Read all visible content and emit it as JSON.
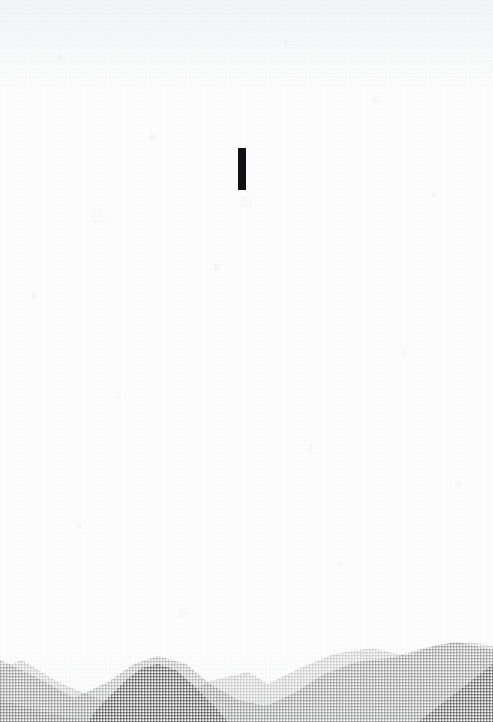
{
  "poster": {
    "width": 493,
    "height": 722,
    "background_color": "#fdfdfd",
    "paper_tone": "off-white mottled scan texture"
  },
  "mark": {
    "name": "vertical-bar-glyph",
    "description": "single bold black vertical stroke, like a text cursor or letter I",
    "color": "#111115",
    "x": 238,
    "y": 148,
    "width": 8,
    "height": 42
  },
  "mountains": {
    "texture": "crosshatch halftone grid",
    "baseline_y": 722,
    "layers": [
      {
        "name": "far-light-range",
        "color": "#e2e2e2",
        "path": "M0,676 L22,668 L58,690 L96,706 L140,714 L186,700 L214,688 L248,680 L268,692 L300,676 L334,662 L372,656 L406,664 L440,652 L470,650 L493,654 L493,100 L0,100 Z"
      },
      {
        "name": "mid-range",
        "color": "#cfcfcf",
        "path": "M0,668 L34,684 L74,706 L108,690 L134,672 L158,664 L186,672 L210,692 L238,708 L266,714 L296,700 L324,682 L356,670 L392,666 L424,656 L456,650 L493,658"
      },
      {
        "name": "near-dark-range",
        "color": "#969696",
        "path": "M96,710 L112,694 L126,680 L142,668 L158,664 L176,670 L192,684 L206,698 L218,710"
      },
      {
        "name": "right-dark-wedge",
        "color": "#9e9e9e",
        "path": "M418,722 L493,664 L493,722 Z"
      },
      {
        "name": "left-foreground-wedge",
        "color": "#bcbcbc",
        "path": "M0,700 L60,716 L96,722 L0,722 Z"
      }
    ]
  }
}
